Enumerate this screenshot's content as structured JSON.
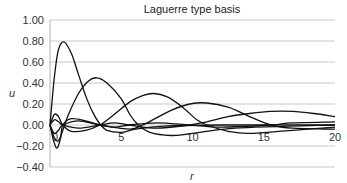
{
  "chart_data": {
    "type": "line",
    "title": "Laguerre type basis",
    "xlabel": "r",
    "ylabel": "u",
    "xlim": [
      0,
      20
    ],
    "ylim": [
      -0.4,
      1.0
    ],
    "x_ticks": [
      "0",
      "5",
      "10",
      "15",
      "20"
    ],
    "y_ticks": [
      "1.00",
      "0.80",
      "0.60",
      "0.40",
      "0.20",
      "0.00",
      "-0.20",
      "-0.40"
    ],
    "grid": true,
    "legend": "none",
    "series": [
      {
        "name": "basis-1",
        "points": [
          [
            0,
            0
          ],
          [
            0.3,
            0.45
          ],
          [
            0.6,
            0.72
          ],
          [
            1.0,
            0.79
          ],
          [
            1.5,
            0.68
          ],
          [
            2.0,
            0.48
          ],
          [
            2.5,
            0.28
          ],
          [
            3.0,
            0.12
          ],
          [
            3.5,
            0.01
          ],
          [
            4.0,
            -0.05
          ],
          [
            5.0,
            -0.07
          ],
          [
            6.0,
            -0.04
          ],
          [
            8.0,
            -0.01
          ],
          [
            12,
            0.0
          ],
          [
            20,
            0.0
          ]
        ]
      },
      {
        "name": "basis-2",
        "points": [
          [
            0,
            0
          ],
          [
            0.3,
            -0.12
          ],
          [
            0.6,
            -0.15
          ],
          [
            0.9,
            -0.05
          ],
          [
            1.3,
            0.1
          ],
          [
            2.0,
            0.3
          ],
          [
            2.7,
            0.42
          ],
          [
            3.3,
            0.45
          ],
          [
            4.0,
            0.4
          ],
          [
            5.0,
            0.25
          ],
          [
            5.6,
            0.1
          ],
          [
            6.2,
            0.0
          ],
          [
            7.0,
            -0.07
          ],
          [
            8.5,
            -0.1
          ],
          [
            10,
            -0.08
          ],
          [
            13,
            -0.03
          ],
          [
            20,
            0.0
          ]
        ]
      },
      {
        "name": "basis-3",
        "points": [
          [
            0,
            0
          ],
          [
            0.3,
            0.1
          ],
          [
            0.6,
            0.08
          ],
          [
            0.9,
            0.0
          ],
          [
            1.5,
            -0.06
          ],
          [
            2.5,
            -0.05
          ],
          [
            3.5,
            0.0
          ],
          [
            4.5,
            0.1
          ],
          [
            5.6,
            0.22
          ],
          [
            6.5,
            0.28
          ],
          [
            7.3,
            0.3
          ],
          [
            8.2,
            0.27
          ],
          [
            9.3,
            0.17
          ],
          [
            10.3,
            0.05
          ],
          [
            11,
            0.0
          ],
          [
            12.5,
            -0.06
          ],
          [
            14,
            -0.08
          ],
          [
            17,
            -0.05
          ],
          [
            20,
            -0.02
          ]
        ]
      },
      {
        "name": "basis-4",
        "points": [
          [
            0,
            0
          ],
          [
            0.3,
            -0.08
          ],
          [
            0.6,
            -0.05
          ],
          [
            0.9,
            0.0
          ],
          [
            2.0,
            0.04
          ],
          [
            3.5,
            0.0
          ],
          [
            5.6,
            -0.04
          ],
          [
            6.5,
            0.0
          ],
          [
            7.5,
            0.07
          ],
          [
            8.5,
            0.14
          ],
          [
            9.8,
            0.2
          ],
          [
            11,
            0.21
          ],
          [
            12.5,
            0.17
          ],
          [
            14,
            0.08
          ],
          [
            15.5,
            0.0
          ],
          [
            17,
            -0.03
          ],
          [
            20,
            -0.04
          ]
        ]
      },
      {
        "name": "basis-5",
        "points": [
          [
            0,
            0
          ],
          [
            0.3,
            0.05
          ],
          [
            0.6,
            0.03
          ],
          [
            0.9,
            0.0
          ],
          [
            2.0,
            -0.03
          ],
          [
            3.5,
            0.0
          ],
          [
            4.5,
            0.02
          ],
          [
            5.6,
            0.0
          ],
          [
            7.5,
            -0.03
          ],
          [
            9.8,
            0.0
          ],
          [
            11,
            0.03
          ],
          [
            12.5,
            0.08
          ],
          [
            14,
            0.11
          ],
          [
            15.5,
            0.13
          ],
          [
            17,
            0.13
          ],
          [
            18.5,
            0.11
          ],
          [
            20,
            0.08
          ]
        ]
      },
      {
        "name": "basis-6",
        "points": [
          [
            0,
            0
          ],
          [
            0.25,
            -0.15
          ],
          [
            0.5,
            -0.22
          ],
          [
            0.75,
            -0.12
          ],
          [
            0.9,
            0.0
          ],
          [
            1.5,
            0.06
          ],
          [
            2.5,
            0.04
          ],
          [
            3.5,
            0.0
          ],
          [
            4.5,
            -0.02
          ],
          [
            5.6,
            0.0
          ],
          [
            7.5,
            0.02
          ],
          [
            9.8,
            0.0
          ],
          [
            12,
            -0.02
          ],
          [
            15.5,
            0.0
          ],
          [
            17,
            0.02
          ],
          [
            20,
            0.03
          ]
        ]
      }
    ]
  }
}
